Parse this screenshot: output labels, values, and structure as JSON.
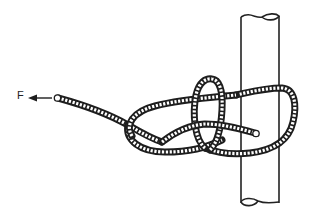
{
  "figure": {
    "type": "line-illustration",
    "labels": {
      "force": "F"
    },
    "arrow": {
      "direction": "left",
      "meaning": "pulling force on the standing part of the rope"
    },
    "colors": {
      "ink": "#1e1e1e",
      "background": "#ffffff"
    },
    "elements": [
      "pole",
      "rope",
      "force-arrow",
      "force-label"
    ]
  }
}
